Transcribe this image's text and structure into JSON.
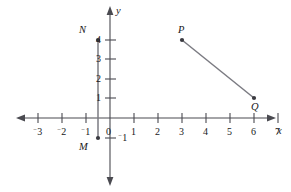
{
  "figure": {
    "type": "coordinate-plane",
    "background_color": "#ffffff",
    "line_color": "#4a4a50",
    "text_color": "#18181a"
  },
  "axes": {
    "x_axis_name": "x",
    "y_axis_name": "y",
    "origin_label": "0",
    "x_ticks": [
      {
        "value": -3,
        "label": "3",
        "negative": true
      },
      {
        "value": -2,
        "label": "2",
        "negative": true
      },
      {
        "value": -1,
        "label": "1",
        "negative": true
      },
      {
        "value": 1,
        "label": "1",
        "negative": false
      },
      {
        "value": 2,
        "label": "2",
        "negative": false
      },
      {
        "value": 3,
        "label": "3",
        "negative": false
      },
      {
        "value": 4,
        "label": "4",
        "negative": false
      },
      {
        "value": 5,
        "label": "5",
        "negative": false
      },
      {
        "value": 6,
        "label": "6",
        "negative": false
      },
      {
        "value": 7,
        "label": "7",
        "negative": false
      }
    ],
    "y_ticks": [
      {
        "value": 4,
        "label": "4",
        "negative": false
      },
      {
        "value": 3,
        "label": "3",
        "negative": false
      },
      {
        "value": 2,
        "label": "2",
        "negative": false
      },
      {
        "value": 1,
        "label": "1",
        "negative": false
      },
      {
        "value": -1,
        "label": "1",
        "negative": true
      }
    ],
    "x_range": [
      -3.8,
      7.6
    ],
    "y_range": [
      -2.2,
      4.9
    ]
  },
  "points": {
    "N": {
      "label": "N",
      "x": -0.5,
      "y": 4
    },
    "M": {
      "label": "M",
      "x": -0.5,
      "y": -1
    },
    "P": {
      "label": "P",
      "x": 3,
      "y": 4
    },
    "Q": {
      "label": "Q",
      "x": 6,
      "y": 1
    }
  },
  "segments": [
    {
      "name": "MN",
      "from": "M",
      "to": "N"
    },
    {
      "name": "PQ",
      "from": "P",
      "to": "Q"
    }
  ],
  "tick_text": {
    "x_m3": "3",
    "x_m2": "2",
    "x_m1": "1",
    "x_1": "1",
    "x_2": "2",
    "x_3": "3",
    "x_4": "4",
    "x_5": "5",
    "x_6": "6",
    "x_7": "7",
    "y_4": "4",
    "y_3": "3",
    "y_2": "2",
    "y_1": "1",
    "y_m1": "1",
    "origin": "0",
    "minus": "−"
  }
}
